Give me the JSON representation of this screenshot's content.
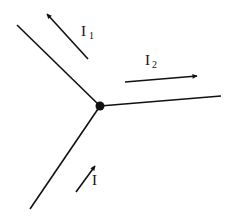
{
  "diagram": {
    "type": "circuit-junction",
    "colors": {
      "line": "#111111",
      "background": "#ffffff"
    },
    "junction": {
      "x": 100,
      "y": 106,
      "r": 4.5
    },
    "wires": [
      {
        "name": "wire-upper-left",
        "x1": 17,
        "y1": 25,
        "x2": 100,
        "y2": 106
      },
      {
        "name": "wire-right",
        "x1": 221,
        "y1": 96,
        "x2": 100,
        "y2": 106
      },
      {
        "name": "wire-lower-left",
        "x1": 30,
        "y1": 209,
        "x2": 100,
        "y2": 106
      }
    ],
    "currents": [
      {
        "name": "current-arrow-i1",
        "label": "I",
        "sub": "1",
        "x1": 88,
        "y1": 59,
        "x2": 47,
        "y2": 14,
        "lx": 81,
        "ly": 36,
        "sx": 89,
        "sy": 39
      },
      {
        "name": "current-arrow-i2",
        "label": "I",
        "sub": "2",
        "x1": 125,
        "y1": 82,
        "x2": 197,
        "y2": 76,
        "lx": 145,
        "ly": 65,
        "sx": 152,
        "sy": 68
      },
      {
        "name": "current-arrow-i",
        "label": "I",
        "sub": "",
        "x1": 76,
        "y1": 192,
        "x2": 95,
        "y2": 166,
        "lx": 92,
        "ly": 185,
        "sx": 0,
        "sy": 0
      }
    ]
  }
}
